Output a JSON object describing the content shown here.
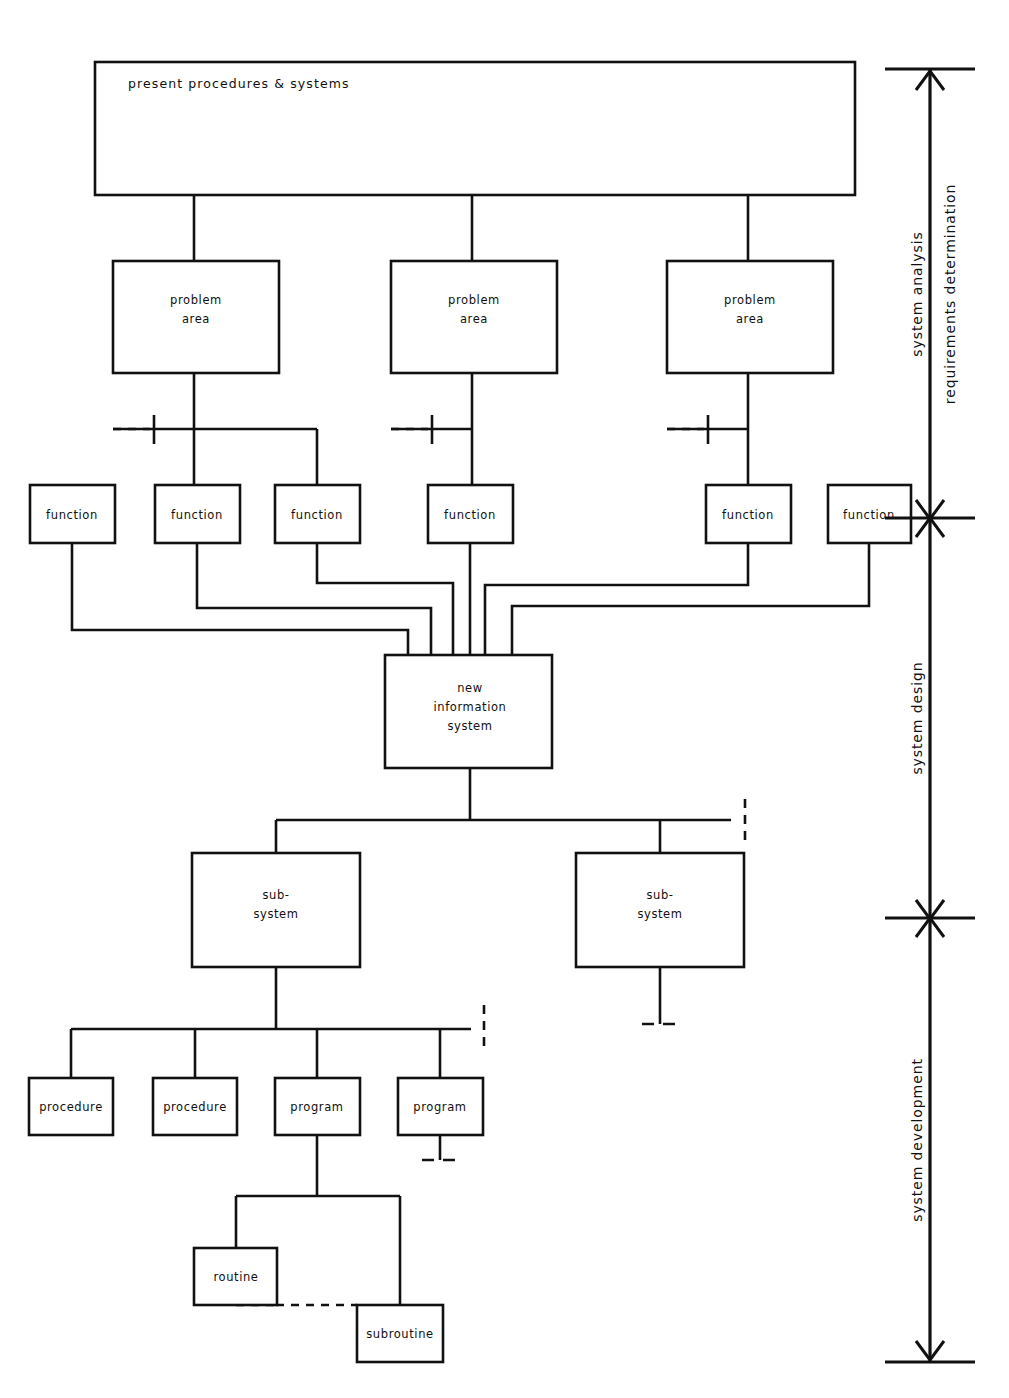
{
  "diagram": {
    "title_box": {
      "label": "present  procedures  &  systems"
    },
    "nodes": {
      "problem_area": "problem\narea",
      "problem_area_line1": "problem",
      "problem_area_line2": "area",
      "function": "function",
      "new_information_system_line1": "new",
      "new_information_system_line2": "information",
      "new_information_system_line3": "system",
      "subsystem_line1": "sub-",
      "subsystem_line2": "system",
      "procedure": "procedure",
      "program": "program",
      "routine": "routine",
      "subroutine": "subroutine"
    },
    "boxes": [
      {
        "id": "present-procedures-and-systems",
        "label": "present  procedures  &  systems"
      },
      {
        "id": "problem-area-1",
        "label": "problem area"
      },
      {
        "id": "problem-area-2",
        "label": "problem area"
      },
      {
        "id": "problem-area-3",
        "label": "problem area"
      },
      {
        "id": "function-1",
        "label": "function"
      },
      {
        "id": "function-2",
        "label": "function"
      },
      {
        "id": "function-3",
        "label": "function"
      },
      {
        "id": "function-4",
        "label": "function"
      },
      {
        "id": "function-5",
        "label": "function"
      },
      {
        "id": "function-6",
        "label": "function"
      },
      {
        "id": "new-information-system",
        "label": "new information system"
      },
      {
        "id": "sub-system-1",
        "label": "sub-system"
      },
      {
        "id": "sub-system-2",
        "label": "sub-system"
      },
      {
        "id": "procedure-1",
        "label": "procedure"
      },
      {
        "id": "procedure-2",
        "label": "procedure"
      },
      {
        "id": "program-1",
        "label": "program"
      },
      {
        "id": "program-2",
        "label": "program"
      },
      {
        "id": "routine-1",
        "label": "routine"
      },
      {
        "id": "subroutine-1",
        "label": "subroutine"
      }
    ],
    "phases": [
      {
        "id": "phase-system-analysis",
        "label": "system analysis"
      },
      {
        "id": "phase-requirements-determination",
        "label": "requirements determination"
      },
      {
        "id": "phase-system-design",
        "label": "system design"
      },
      {
        "id": "phase-system-development",
        "label": "system development"
      }
    ],
    "colors": {
      "line": "#111111",
      "text": "#101010",
      "background": "#ffffff"
    }
  }
}
